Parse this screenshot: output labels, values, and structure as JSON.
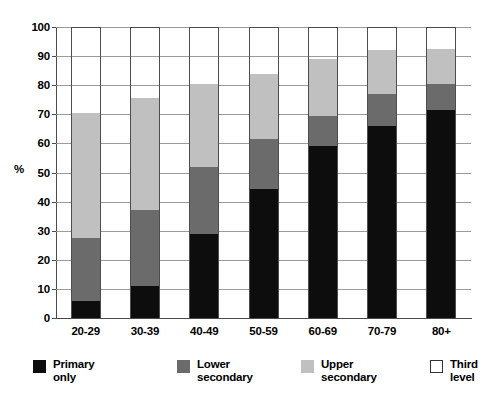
{
  "chart_data": {
    "type": "bar",
    "subtype": "stacked-bar-100",
    "title": "",
    "xlabel": "",
    "ylabel": "%",
    "ylim": [
      0,
      100
    ],
    "yticks": [
      0,
      10,
      20,
      30,
      40,
      50,
      60,
      70,
      80,
      90,
      100
    ],
    "ytick_labels": [
      "0",
      "10",
      "20",
      "30",
      "40",
      "50",
      "60",
      "70",
      "80",
      "90",
      "100"
    ],
    "grid": true,
    "grid_axis": "y",
    "legend_position": "bottom",
    "categories": [
      "20-29",
      "30-39",
      "40-49",
      "50-59",
      "60-69",
      "70-79",
      "80+"
    ],
    "series": [
      {
        "name": "Primary only",
        "color": "#0d0d0d",
        "values": [
          6,
          11,
          29,
          44.5,
          59,
          66,
          71.5
        ]
      },
      {
        "name": "Lower secondary",
        "color": "#6b6b6b",
        "values": [
          21.5,
          26,
          23,
          17,
          10.5,
          11,
          9
        ]
      },
      {
        "name": "Upper secondary",
        "color": "#c0c0c0",
        "values": [
          43,
          38.5,
          28.5,
          22.5,
          19.5,
          15,
          12
        ]
      },
      {
        "name": "Third level",
        "color": "#ffffff",
        "values": [
          29.5,
          24.5,
          19.5,
          16,
          11,
          8,
          7.5
        ]
      }
    ],
    "cumulative_tops": {
      "primary_only": [
        6,
        11,
        29,
        44.5,
        59,
        66,
        71.5
      ],
      "lower_secondary": [
        27.5,
        37,
        52,
        61.5,
        69.5,
        77,
        80.5
      ],
      "upper_secondary": [
        70.5,
        75.5,
        80.5,
        84,
        89,
        92,
        92.5
      ],
      "third_level": [
        100,
        100,
        100,
        100,
        100,
        100,
        100
      ]
    }
  },
  "axis": {
    "unit_label": "%",
    "y_tick_labels": [
      "100",
      "90",
      "80",
      "70",
      "60",
      "50",
      "40",
      "30",
      "20",
      "10",
      "0"
    ],
    "x_tick_labels": [
      "20-29",
      "30-39",
      "40-49",
      "50-59",
      "60-69",
      "70-79",
      "80+"
    ]
  },
  "legend": {
    "items": [
      {
        "label": "Primary\nonly",
        "swatch": "primary-swatch"
      },
      {
        "label": "Lower\nsecondary",
        "swatch": "lower-swatch"
      },
      {
        "label": "Upper\nsecondary",
        "swatch": "upper-swatch"
      },
      {
        "label": "Third\nlevel",
        "swatch": "third-swatch"
      }
    ]
  },
  "colors": {
    "primary_only": "#0d0d0d",
    "lower_secondary": "#6b6b6b",
    "upper_secondary": "#c0c0c0",
    "third_level": "#ffffff",
    "outline": "#4d4d4d",
    "gridline": "#9b9b9b",
    "axis": "#4a4a4a",
    "background": "#ffffff"
  }
}
